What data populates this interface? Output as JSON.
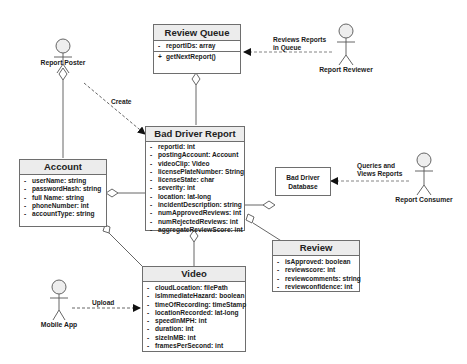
{
  "diagram": {
    "type": "UML class diagram",
    "classes": {
      "review_queue": {
        "name": "Review Queue",
        "attributes": [
          {
            "vis": "-",
            "text": "reportIDs: array"
          }
        ],
        "methods": [
          {
            "vis": "+",
            "text": "getNextReport()"
          }
        ]
      },
      "bad_driver_report": {
        "name": "Bad Driver Report",
        "attributes": [
          {
            "vis": "-",
            "text": "reportid: int"
          },
          {
            "vis": "-",
            "text": "postingAccount: Account"
          },
          {
            "vis": "-",
            "text": "videoClip: Video"
          },
          {
            "vis": "-",
            "text": "licensePlateNumber: String"
          },
          {
            "vis": "-",
            "text": "licenseState: char"
          },
          {
            "vis": "-",
            "text": "severity: int"
          },
          {
            "vis": "-",
            "text": "location: lat-long"
          },
          {
            "vis": "-",
            "text": "incidentDescription: string"
          },
          {
            "vis": "-",
            "text": "numApprovedReviews: int"
          },
          {
            "vis": "-",
            "text": "numRejectedReviews: int"
          },
          {
            "vis": "-",
            "text": "aggregateReviewScore: int"
          }
        ]
      },
      "account": {
        "name": "Account",
        "attributes": [
          {
            "vis": "-",
            "text": "userName: string"
          },
          {
            "vis": "-",
            "text": "passwordHash: string"
          },
          {
            "vis": "-",
            "text": "full Name: string"
          },
          {
            "vis": "-",
            "text": "phoneNumber: int"
          },
          {
            "vis": "-",
            "text": "accountType: string"
          }
        ]
      },
      "review": {
        "name": "Review",
        "attributes": [
          {
            "vis": "-",
            "text": "isApproved: boolean"
          },
          {
            "vis": "-",
            "text": "reviewscore: int"
          },
          {
            "vis": "-",
            "text": "reviewcomments: string"
          },
          {
            "vis": "-",
            "text": "reviewconfidence: int"
          }
        ]
      },
      "video": {
        "name": "Video",
        "attributes": [
          {
            "vis": "-",
            "text": "cloudLocation: filePath"
          },
          {
            "vis": "-",
            "text": "isImmediateHazard: boolean"
          },
          {
            "vis": "-",
            "text": "timeOfRecording: timeStamp"
          },
          {
            "vis": "-",
            "text": "locationRecorded: lat-long"
          },
          {
            "vis": "-",
            "text": "speedInMPH: int"
          },
          {
            "vis": "-",
            "text": "duration: int"
          },
          {
            "vis": "-",
            "text": "sizeInMB: int"
          },
          {
            "vis": "-",
            "text": "framesPerSecond: int"
          }
        ]
      }
    },
    "database": {
      "line1": "Bad Driver",
      "line2": "Database"
    },
    "actors": {
      "report_poster": "Report Poster",
      "report_reviewer": "Report Reviewer",
      "report_consumer": "Report Consumer",
      "mobile_app": "Mobile App"
    },
    "edge_labels": {
      "create": "Create",
      "reviews_line1": "Reviews Reports",
      "reviews_line2": "in Queue",
      "queries_line1": "Queries and",
      "queries_line2": "Views Reports",
      "upload": "Upload"
    },
    "colors": {
      "line": "#555555",
      "header_fill": "#ececec",
      "border": "#6e6e6e",
      "actor_head_fill": "#eeeeee"
    }
  }
}
